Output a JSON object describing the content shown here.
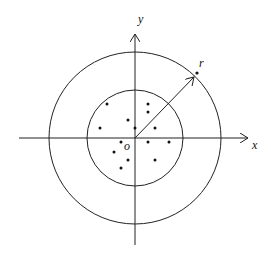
{
  "diagram": {
    "labels": {
      "x_axis": "x",
      "y_axis": "y",
      "origin": "o",
      "radius": "r"
    },
    "origin": [
      135,
      138
    ],
    "inner_circle_radius": 48,
    "outer_circle_radius": 87,
    "points": [
      [
        107,
        104
      ],
      [
        148,
        104
      ],
      [
        148,
        112
      ],
      [
        128,
        120
      ],
      [
        100,
        128
      ],
      [
        135,
        128
      ],
      [
        155,
        128
      ],
      [
        121,
        142
      ],
      [
        148,
        142
      ],
      [
        169,
        142
      ],
      [
        114,
        152
      ],
      [
        128,
        160
      ],
      [
        155,
        160
      ],
      [
        121,
        168
      ]
    ],
    "radius_arrow": {
      "from": [
        135,
        138
      ],
      "to": [
        194,
        77
      ]
    },
    "radius_point": [
      197,
      73
    ],
    "colors": {
      "stroke": "#222222",
      "background": "#ffffff"
    }
  }
}
